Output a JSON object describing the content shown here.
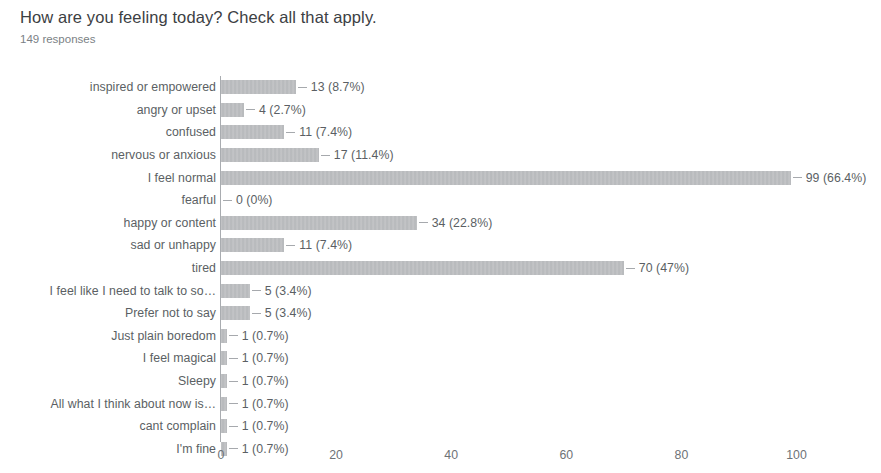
{
  "survey": {
    "question": "How are you feeling today? Check all that apply.",
    "response_count_label": "149 responses"
  },
  "chart_data": {
    "type": "bar",
    "orientation": "horizontal",
    "title": "How are you feeling today? Check all that apply.",
    "subtitle": "149 responses",
    "xlabel": "",
    "ylabel": "",
    "xlim": [
      0,
      108
    ],
    "grid": false,
    "legend": null,
    "total_responses": 149,
    "axis_ticks": [
      "0",
      "20",
      "40",
      "60",
      "80",
      "100"
    ],
    "axis_tick_values": [
      0,
      20,
      40,
      60,
      80,
      100
    ],
    "bar_color": "#9a9da1",
    "categories": [
      "inspired or empowered",
      "angry or upset",
      "confused",
      "nervous or anxious",
      "I feel normal",
      "fearful",
      "happy or content",
      "sad or unhappy",
      "tired",
      "I feel like I need to talk to so…",
      "Prefer not to say",
      "Just plain boredom",
      "I feel magical",
      "Sleepy",
      "All what I think about now is…",
      "cant complain",
      "I'm fine"
    ],
    "values": [
      13,
      4,
      11,
      17,
      99,
      0,
      34,
      11,
      70,
      5,
      5,
      1,
      1,
      1,
      1,
      1,
      1
    ],
    "percents": [
      8.7,
      2.7,
      7.4,
      11.4,
      66.4,
      0,
      22.8,
      7.4,
      47,
      3.4,
      3.4,
      0.7,
      0.7,
      0.7,
      0.7,
      0.7,
      0.7
    ],
    "data_labels": [
      "13 (8.7%)",
      "4 (2.7%)",
      "11 (7.4%)",
      "17 (11.4%)",
      "99 (66.4%)",
      "0 (0%)",
      "34 (22.8%)",
      "11 (7.4%)",
      "70 (47%)",
      "5 (3.4%)",
      "5 (3.4%)",
      "1 (0.7%)",
      "1 (0.7%)",
      "1 (0.7%)",
      "1 (0.7%)",
      "1 (0.7%)",
      "1 (0.7%)"
    ]
  },
  "rows": [
    {
      "label": "inspired or empowered",
      "value": 13,
      "data_label": "13 (8.7%)"
    },
    {
      "label": "angry or upset",
      "value": 4,
      "data_label": "4 (2.7%)"
    },
    {
      "label": "confused",
      "value": 11,
      "data_label": "11 (7.4%)"
    },
    {
      "label": "nervous or anxious",
      "value": 17,
      "data_label": "17 (11.4%)"
    },
    {
      "label": "I feel normal",
      "value": 99,
      "data_label": "99 (66.4%)"
    },
    {
      "label": "fearful",
      "value": 0,
      "data_label": "0 (0%)"
    },
    {
      "label": "happy or content",
      "value": 34,
      "data_label": "34 (22.8%)"
    },
    {
      "label": "sad or unhappy",
      "value": 11,
      "data_label": "11 (7.4%)"
    },
    {
      "label": "tired",
      "value": 70,
      "data_label": "70 (47%)"
    },
    {
      "label": "I feel like I need to talk to so…",
      "value": 5,
      "data_label": "5 (3.4%)"
    },
    {
      "label": "Prefer not to say",
      "value": 5,
      "data_label": "5 (3.4%)"
    },
    {
      "label": "Just plain boredom",
      "value": 1,
      "data_label": "1 (0.7%)"
    },
    {
      "label": "I feel magical",
      "value": 1,
      "data_label": "1 (0.7%)"
    },
    {
      "label": "Sleepy",
      "value": 1,
      "data_label": "1 (0.7%)"
    },
    {
      "label": "All what I think about now is…",
      "value": 1,
      "data_label": "1 (0.7%)"
    },
    {
      "label": "cant complain",
      "value": 1,
      "data_label": "1 (0.7%)"
    },
    {
      "label": "I'm fine",
      "value": 1,
      "data_label": "1 (0.7%)"
    }
  ],
  "axis": {
    "ticks": [
      {
        "label": "0",
        "value": 0
      },
      {
        "label": "20",
        "value": 20
      },
      {
        "label": "40",
        "value": 40
      },
      {
        "label": "60",
        "value": 60
      },
      {
        "label": "80",
        "value": 80
      },
      {
        "label": "100",
        "value": 100
      }
    ]
  }
}
